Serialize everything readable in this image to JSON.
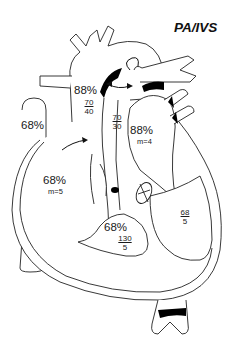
{
  "title": "PA/IVS",
  "colors": {
    "line": "#222222",
    "fill": "#ffffff",
    "valve": "#000000",
    "text": "#1a1a1a"
  },
  "labels": {
    "aorta_sat": "88%",
    "aorta_pressure": {
      "systolic": "70",
      "diastolic": "40"
    },
    "pda_pressure": {
      "systolic": "70",
      "diastolic": "30"
    },
    "ivc_sat": "68%",
    "la_sat": "88%",
    "la_mean": "m=4",
    "ra_sat": "68%",
    "ra_mean": "m=5",
    "rv_sat": "68%",
    "rv_pressure": {
      "systolic": "130",
      "diastolic": "5"
    },
    "lv_pressure": {
      "systolic": "68",
      "diastolic": "5"
    }
  }
}
